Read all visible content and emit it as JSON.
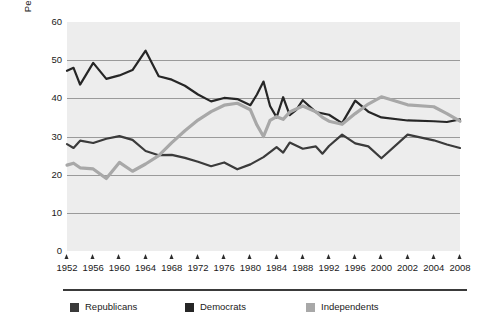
{
  "chart_data": {
    "type": "line",
    "title": "",
    "xlabel": "",
    "ylabel": "Percentage of Americans",
    "ylim": [
      0,
      60
    ],
    "ytick_values": [
      0,
      10,
      20,
      30,
      40,
      50,
      60
    ],
    "ytick_labels": [
      "0",
      "10",
      "20",
      "30",
      "40",
      "50",
      "60"
    ],
    "grid": "horizontal",
    "legend_position": "bottom-left",
    "categories": [
      "1952",
      "1956",
      "1960",
      "1964",
      "1968",
      "1972",
      "1976",
      "1980",
      "1984",
      "1988",
      "1992",
      "1996",
      "2000",
      "2002",
      "2004",
      "2008"
    ],
    "x_positions_note": "ticks are evenly spaced across the axis",
    "series": [
      {
        "name": "Republicans",
        "color": "#3a3a3a",
        "points": [
          [
            1952,
            28.0
          ],
          [
            1953,
            27.0
          ],
          [
            1954,
            28.9
          ],
          [
            1956,
            28.3
          ],
          [
            1958,
            29.4
          ],
          [
            1960,
            30.1
          ],
          [
            1962,
            29.1
          ],
          [
            1964,
            26.2
          ],
          [
            1966,
            25.1
          ],
          [
            1968,
            25.2
          ],
          [
            1970,
            24.4
          ],
          [
            1972,
            23.4
          ],
          [
            1974,
            22.2
          ],
          [
            1976,
            23.2
          ],
          [
            1978,
            21.4
          ],
          [
            1980,
            22.7
          ],
          [
            1982,
            24.6
          ],
          [
            1984,
            27.2
          ],
          [
            1985,
            25.8
          ],
          [
            1986,
            28.4
          ],
          [
            1988,
            26.8
          ],
          [
            1990,
            27.4
          ],
          [
            1991,
            25.5
          ],
          [
            1992,
            27.5
          ],
          [
            1994,
            30.5
          ],
          [
            1996,
            28.2
          ],
          [
            1998,
            27.4
          ],
          [
            2000,
            24.3
          ],
          [
            2002,
            30.5
          ],
          [
            2004,
            29.0
          ],
          [
            2006,
            27.9
          ],
          [
            2008,
            27.0
          ]
        ]
      },
      {
        "name": "Democrats",
        "color": "#262626",
        "points": [
          [
            1952,
            47.2
          ],
          [
            1953,
            48.0
          ],
          [
            1954,
            43.6
          ],
          [
            1956,
            49.3
          ],
          [
            1958,
            45.1
          ],
          [
            1960,
            46.0
          ],
          [
            1962,
            47.4
          ],
          [
            1964,
            52.5
          ],
          [
            1966,
            45.8
          ],
          [
            1968,
            44.9
          ],
          [
            1970,
            43.3
          ],
          [
            1972,
            41.0
          ],
          [
            1974,
            39.2
          ],
          [
            1976,
            40.1
          ],
          [
            1978,
            39.8
          ],
          [
            1980,
            38.2
          ],
          [
            1981,
            41.0
          ],
          [
            1982,
            44.4
          ],
          [
            1983,
            38.0
          ],
          [
            1984,
            35.0
          ],
          [
            1985,
            40.3
          ],
          [
            1986,
            35.6
          ],
          [
            1987,
            37.0
          ],
          [
            1988,
            39.5
          ],
          [
            1990,
            36.4
          ],
          [
            1992,
            35.7
          ],
          [
            1994,
            33.5
          ],
          [
            1996,
            39.4
          ],
          [
            1998,
            36.5
          ],
          [
            2000,
            35.0
          ],
          [
            2002,
            34.2
          ],
          [
            2004,
            34.0
          ],
          [
            2006,
            33.8
          ],
          [
            2008,
            34.5
          ]
        ]
      },
      {
        "name": "Independents",
        "color": "#a8a8a8",
        "points": [
          [
            1952,
            22.5
          ],
          [
            1953,
            23.0
          ],
          [
            1954,
            21.8
          ],
          [
            1956,
            21.5
          ],
          [
            1958,
            19.0
          ],
          [
            1960,
            23.2
          ],
          [
            1962,
            20.9
          ],
          [
            1964,
            22.8
          ],
          [
            1966,
            25.0
          ],
          [
            1968,
            28.4
          ],
          [
            1970,
            31.5
          ],
          [
            1972,
            34.3
          ],
          [
            1974,
            36.5
          ],
          [
            1976,
            38.2
          ],
          [
            1978,
            38.7
          ],
          [
            1980,
            37.0
          ],
          [
            1981,
            33.0
          ],
          [
            1982,
            30.0
          ],
          [
            1983,
            34.2
          ],
          [
            1984,
            35.2
          ],
          [
            1985,
            34.5
          ],
          [
            1986,
            36.4
          ],
          [
            1988,
            38.0
          ],
          [
            1990,
            36.5
          ],
          [
            1991,
            35.0
          ],
          [
            1992,
            34.0
          ],
          [
            1994,
            33.2
          ],
          [
            1996,
            36.0
          ],
          [
            1998,
            38.5
          ],
          [
            2000,
            40.4
          ],
          [
            2002,
            38.3
          ],
          [
            2004,
            37.8
          ],
          [
            2006,
            36.0
          ],
          [
            2008,
            34.0
          ]
        ]
      }
    ]
  },
  "legend": {
    "entries": [
      {
        "label": "Republicans",
        "color": "#3a3a3a"
      },
      {
        "label": "Democrats",
        "color": "#262626"
      },
      {
        "label": "Independents",
        "color": "#a8a8a8"
      }
    ]
  },
  "colors": {
    "plot_background": "#ededed",
    "gridline": "#9a9a9a",
    "text": "#1a1a1a",
    "rule": "#3a3a3a",
    "page_background": "#ffffff"
  }
}
